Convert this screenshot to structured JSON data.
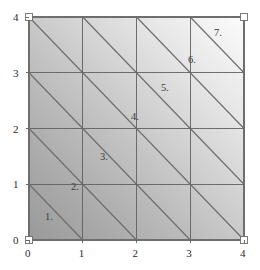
{
  "figure": {
    "title": "",
    "plot_area": {
      "left": 29,
      "top": 17,
      "right": 244,
      "bottom": 240
    },
    "frame_color": "#6e6e6e",
    "grid_color": "#5a5a5a",
    "diagonal_color": "#6a6a6a",
    "corner_marker_color": "#ffffff",
    "fill_dark": "#9d9d9d",
    "fill_light": "#fafafa"
  },
  "axes": {
    "x": {
      "min": 0,
      "max": 4,
      "ticks": [
        {
          "value": 0,
          "label": "0",
          "px": 29
        },
        {
          "value": 1,
          "label": "1",
          "px": 83
        },
        {
          "value": 2,
          "label": "2",
          "px": 137
        },
        {
          "value": 3,
          "label": "3",
          "px": 190
        },
        {
          "value": 4,
          "label": "4",
          "px": 244
        }
      ]
    },
    "y": {
      "min": 0,
      "max": 4,
      "ticks": [
        {
          "value": 0,
          "label": "0",
          "px": 240
        },
        {
          "value": 1,
          "label": "1",
          "px": 184
        },
        {
          "value": 2,
          "label": "2",
          "px": 128
        },
        {
          "value": 3,
          "label": "3",
          "px": 73
        },
        {
          "value": 4,
          "label": "4",
          "px": 17
        }
      ]
    }
  },
  "chart_data": {
    "type": "diagram",
    "title": "",
    "subtitle": "",
    "xlabel": "",
    "ylabel": "",
    "xlim": [
      0,
      4
    ],
    "ylim": [
      0,
      4
    ],
    "grid": true,
    "legend": "none",
    "grid_divisions": 4,
    "cell_size": 1,
    "triangle_count": 32,
    "diagonal_direction": "anti-diagonal (top-left to bottom-right of each cell)",
    "gridlines_x": [
      0,
      1,
      2,
      3,
      4
    ],
    "gridlines_y": [
      0,
      1,
      2,
      3,
      4
    ],
    "corner_markers": [
      {
        "x": 0,
        "y": 0
      },
      {
        "x": 4,
        "y": 0
      },
      {
        "x": 0,
        "y": 4
      },
      {
        "x": 4,
        "y": 4
      }
    ],
    "labels": [
      {
        "text": "1.",
        "x": 0.32,
        "y": 0.42,
        "px": 45,
        "py": 212
      },
      {
        "text": "2.",
        "x": 0.84,
        "y": 0.92,
        "px": 71,
        "py": 182
      },
      {
        "text": "3.",
        "x": 1.38,
        "y": 1.45,
        "px": 100,
        "py": 152
      },
      {
        "text": "4.",
        "x": 1.96,
        "y": 2.02,
        "px": 131,
        "py": 112
      },
      {
        "text": "5.",
        "x": 2.52,
        "y": 2.55,
        "px": 161,
        "py": 83
      },
      {
        "text": "6.",
        "x": 3.02,
        "y": 3.05,
        "px": 188,
        "py": 55
      },
      {
        "text": "7.",
        "x": 3.52,
        "y": 3.55,
        "px": 214,
        "py": 28
      }
    ]
  }
}
